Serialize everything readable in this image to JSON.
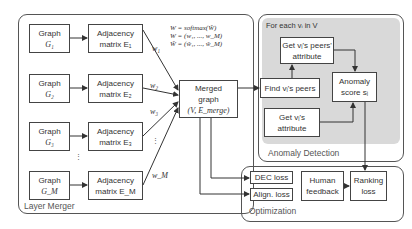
{
  "layer_merger": {
    "label": "Layer Merger",
    "graphs": [
      {
        "title": "Graph",
        "symbol": "G₁",
        "matrix_title": "Adjacency",
        "matrix_label": "matrix E₁",
        "weight": "w₁"
      },
      {
        "title": "Graph",
        "symbol": "G₂",
        "matrix_title": "Adjacency",
        "matrix_label": "matrix E₂",
        "weight": "w₂"
      },
      {
        "title": "Graph",
        "symbol": "G₃",
        "matrix_title": "Adjacency",
        "matrix_label": "matrix E₃",
        "weight": "w₃"
      },
      {
        "title": "Graph",
        "symbol": "G_M",
        "matrix_title": "Adjacency",
        "matrix_label": "matrix E_M",
        "weight": "w_M"
      }
    ],
    "ellipsis": "⋮",
    "formulas": [
      "W = softmax(W̃)",
      "W = (w₁, ..., w_M)",
      "W̃ = (w̃₁, ..., w̃_M)"
    ],
    "merged": {
      "line1": "Merged",
      "line2": "graph",
      "line3": "(V, E_merge)"
    }
  },
  "anomaly_detection": {
    "label": "Anomaly Detection",
    "loop_label": "For each vᵢ in V",
    "peers_attr": {
      "line1": "Get vᵢ's peers'",
      "line2": "attribute"
    },
    "find_peers": "Find vᵢ's peers",
    "get_attr": {
      "line1": "Get vᵢ's",
      "line2": "attribute"
    },
    "score": {
      "line1": "Anomaly",
      "line2": "score sᵢ"
    }
  },
  "optimization": {
    "label": "Optimization",
    "dec_loss": "DEC loss",
    "align_loss": "Align. loss",
    "human_feedback": {
      "line1": "Human",
      "line2": "feedback"
    },
    "ranking_loss": {
      "line1": "Ranking",
      "line2": "loss"
    }
  },
  "colors": {
    "frame": "#555555",
    "panel": "#d9d9d9",
    "box_border": "#444444"
  }
}
